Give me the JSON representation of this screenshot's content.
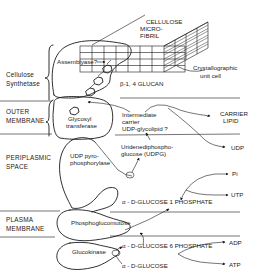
{
  "regions": {
    "cellulose_synthetase": [
      "Cellulose",
      "Synthetase"
    ],
    "outer_membrane": [
      "OUTER",
      "MEMBRANE"
    ],
    "periplasmic_space": [
      "PERIPLASMIC",
      "SPACE"
    ],
    "plasma_membrane": [
      "PLASMA",
      "MEMBRANE"
    ]
  },
  "structures": {
    "microfibril": [
      "CELLULOSE",
      "MICRO-",
      "FIBRIL"
    ],
    "unit_cell": [
      "Crystallographic",
      "unit cell"
    ],
    "glucan": "β-1, 4 GLUCAN"
  },
  "enzymes": {
    "assemblyase": "Assemblyase?",
    "glycosyl_transferase": [
      "Glycosyl",
      "transferase"
    ],
    "udp_pyrophosphorylase": [
      "UDP pyro-",
      "phosphorylase"
    ],
    "phosphoglucomutase": "Phosphoglucomutose",
    "glucokinase": "Glucokinase"
  },
  "intermediates": {
    "carrier": [
      "Intermediate",
      "carrier",
      "UDP-glycolipid ?"
    ],
    "udpg": [
      "Uridenediphospho-",
      "glucose (UDPG)"
    ],
    "g1p": "α - D-GLUCOSE 1 PHOSPHATE",
    "g6p": "α - D-GLUCOSE 6 PHOSPHATE",
    "glucose": "α - D-GLUCOSE"
  },
  "products": {
    "carrier_lipid": [
      "CARRIER",
      "LIPID"
    ],
    "udp": "UDP",
    "pi": "Pi",
    "utp": "UTP",
    "adp": "ADP",
    "atp": "ATP"
  }
}
